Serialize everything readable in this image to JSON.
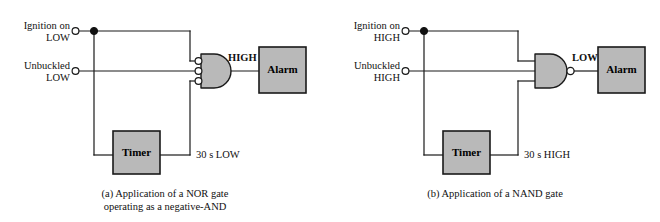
{
  "figure": {
    "background": "#ffffff",
    "fill_gray": "#b9b9b9",
    "line_color": "#1a1a1a"
  },
  "panels": [
    {
      "id": "a",
      "caption_line1": "(a) Application of a NOR gate",
      "caption_line2": "operating as a negative-AND",
      "gate": {
        "type": "negative-AND",
        "shape": "and-d-shape",
        "input_bubbles": 3,
        "output_bubble": false,
        "inputs": 3
      },
      "inputs": [
        {
          "name": "ignition",
          "line1": "Ignition on",
          "line2": "LOW"
        },
        {
          "name": "unbuckled",
          "line1": "Unbuckled",
          "line2": "LOW"
        }
      ],
      "timer": {
        "label": "Timer",
        "output_label": "30 s LOW"
      },
      "output": {
        "label": "HIGH"
      },
      "load": {
        "label": "Alarm"
      }
    },
    {
      "id": "b",
      "caption_line1": "(b) Application of a NAND gate",
      "caption_line2": "",
      "gate": {
        "type": "NAND",
        "shape": "and-d-shape",
        "input_bubbles": 0,
        "output_bubble": true,
        "inputs": 3
      },
      "inputs": [
        {
          "name": "ignition",
          "line1": "Ignition on",
          "line2": "HIGH"
        },
        {
          "name": "unbuckled",
          "line1": "Unbuckled",
          "line2": "HIGH"
        }
      ],
      "timer": {
        "label": "Timer",
        "output_label": "30 s HIGH"
      },
      "output": {
        "label": "LOW"
      },
      "load": {
        "label": "Alarm"
      }
    }
  ]
}
